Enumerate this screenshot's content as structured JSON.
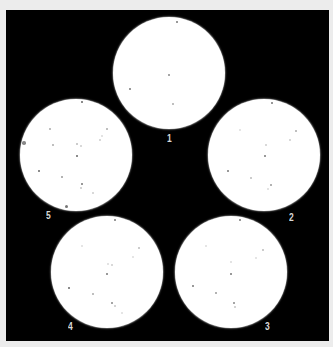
{
  "figure": {
    "background_color": "#000000",
    "page_color": "#ececec",
    "plate_color": "#ffffff",
    "label_color": "#d8d8d8"
  },
  "plates": [
    {
      "label": "1",
      "cx": 169,
      "cy": 73,
      "r": 56,
      "label_x": 167,
      "label_y": 134,
      "dots": [
        {
          "x": 177,
          "y": 22,
          "s": 2,
          "o": 0.8
        },
        {
          "x": 169,
          "y": 75,
          "s": 2,
          "o": 0.7
        },
        {
          "x": 130,
          "y": 89,
          "s": 2.5,
          "o": 0.8
        },
        {
          "x": 173,
          "y": 104,
          "s": 2,
          "o": 0.5
        }
      ]
    },
    {
      "label": "2",
      "cx": 264,
      "cy": 155,
      "r": 56,
      "label_x": 289,
      "label_y": 213,
      "dots": [
        {
          "x": 272,
          "y": 103,
          "s": 2,
          "o": 0.8
        },
        {
          "x": 296,
          "y": 131,
          "s": 2,
          "o": 0.5
        },
        {
          "x": 240,
          "y": 130,
          "s": 2,
          "o": 0.2
        },
        {
          "x": 290,
          "y": 140,
          "s": 2,
          "o": 0.3
        },
        {
          "x": 266,
          "y": 145,
          "s": 2,
          "o": 0.3
        },
        {
          "x": 265,
          "y": 156,
          "s": 2,
          "o": 0.8
        },
        {
          "x": 228,
          "y": 171,
          "s": 2.5,
          "o": 0.8
        },
        {
          "x": 251,
          "y": 178,
          "s": 2,
          "o": 0.4
        },
        {
          "x": 271,
          "y": 185,
          "s": 2,
          "o": 0.6
        },
        {
          "x": 268,
          "y": 189,
          "s": 1.5,
          "o": 0.2
        }
      ]
    },
    {
      "label": "3",
      "cx": 231,
      "cy": 272,
      "r": 56,
      "label_x": 265,
      "label_y": 322,
      "dots": [
        {
          "x": 240,
          "y": 220,
          "s": 2,
          "o": 0.8
        },
        {
          "x": 206,
          "y": 246,
          "s": 2,
          "o": 0.2
        },
        {
          "x": 263,
          "y": 250,
          "s": 2,
          "o": 0.4
        },
        {
          "x": 256,
          "y": 258,
          "s": 2,
          "o": 0.2
        },
        {
          "x": 231,
          "y": 262,
          "s": 1.5,
          "o": 0.2
        },
        {
          "x": 231,
          "y": 274,
          "s": 2,
          "o": 0.8
        },
        {
          "x": 193,
          "y": 286,
          "s": 2,
          "o": 0.8
        },
        {
          "x": 216,
          "y": 293,
          "s": 2,
          "o": 0.6
        },
        {
          "x": 234,
          "y": 303,
          "s": 2,
          "o": 0.7
        },
        {
          "x": 235,
          "y": 307,
          "s": 1.5,
          "o": 0.3
        }
      ]
    },
    {
      "label": "4",
      "cx": 107,
      "cy": 272,
      "r": 56,
      "label_x": 68,
      "label_y": 322,
      "dots": [
        {
          "x": 115,
          "y": 220,
          "s": 2,
          "o": 0.8
        },
        {
          "x": 82,
          "y": 246,
          "s": 2,
          "o": 0.2
        },
        {
          "x": 139,
          "y": 248,
          "s": 2,
          "o": 0.4
        },
        {
          "x": 133,
          "y": 257,
          "s": 2,
          "o": 0.2
        },
        {
          "x": 108,
          "y": 264,
          "s": 1.5,
          "o": 0.2
        },
        {
          "x": 112,
          "y": 265,
          "s": 2,
          "o": 0.3
        },
        {
          "x": 107,
          "y": 274,
          "s": 2,
          "o": 0.8
        },
        {
          "x": 69,
          "y": 288,
          "s": 2.5,
          "o": 0.9
        },
        {
          "x": 93,
          "y": 294,
          "s": 2,
          "o": 0.5
        },
        {
          "x": 112,
          "y": 303,
          "s": 2,
          "o": 0.7
        },
        {
          "x": 115,
          "y": 306,
          "s": 1.5,
          "o": 0.3
        },
        {
          "x": 122,
          "y": 313,
          "s": 2,
          "o": 0.2
        }
      ]
    },
    {
      "label": "5",
      "cx": 76,
      "cy": 155,
      "r": 56,
      "label_x": 46,
      "label_y": 211,
      "dots": [
        {
          "x": 82,
          "y": 102,
          "s": 2.5,
          "o": 0.9
        },
        {
          "x": 50,
          "y": 129,
          "s": 2,
          "o": 0.5
        },
        {
          "x": 107,
          "y": 129,
          "s": 2,
          "o": 0.5
        },
        {
          "x": 24,
          "y": 143,
          "s": 3.5,
          "o": 0.7
        },
        {
          "x": 53,
          "y": 145,
          "s": 2,
          "o": 0.5
        },
        {
          "x": 77,
          "y": 144,
          "s": 2,
          "o": 0.4
        },
        {
          "x": 81,
          "y": 146,
          "s": 2,
          "o": 0.3
        },
        {
          "x": 100,
          "y": 140,
          "s": 2,
          "o": 0.3
        },
        {
          "x": 102,
          "y": 136,
          "s": 1.5,
          "o": 0.2
        },
        {
          "x": 77,
          "y": 156,
          "s": 2,
          "o": 0.9
        },
        {
          "x": 39,
          "y": 171,
          "s": 2.5,
          "o": 0.9
        },
        {
          "x": 62,
          "y": 177,
          "s": 2,
          "o": 0.6
        },
        {
          "x": 82,
          "y": 184,
          "s": 2,
          "o": 0.8
        },
        {
          "x": 81,
          "y": 188,
          "s": 1.5,
          "o": 0.3
        },
        {
          "x": 93,
          "y": 193,
          "s": 2,
          "o": 0.3
        },
        {
          "x": 66,
          "y": 206,
          "s": 3,
          "o": 0.8
        }
      ]
    }
  ]
}
